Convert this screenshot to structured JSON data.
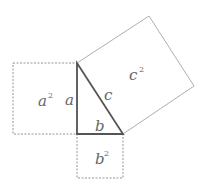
{
  "diagram": {
    "colors": {
      "triangle_stroke": "#555555",
      "square_stroke": "#888888",
      "label": "#666666"
    },
    "triangle": {
      "vertices": [
        [
          77,
          63
        ],
        [
          77,
          134
        ],
        [
          123,
          134
        ]
      ],
      "side_labels": {
        "a": "a",
        "b": "b",
        "c": "c"
      }
    },
    "squares": {
      "a_squared": {
        "label_base": "a",
        "label_exp": "2",
        "vertices": [
          [
            13,
            63
          ],
          [
            77,
            63
          ],
          [
            77,
            134
          ],
          [
            13,
            134
          ]
        ]
      },
      "b_squared": {
        "label_base": "b",
        "label_exp": "2",
        "vertices": [
          [
            77,
            134
          ],
          [
            123,
            134
          ],
          [
            123,
            178
          ],
          [
            77,
            178
          ]
        ]
      },
      "c_squared": {
        "label_base": "c",
        "label_exp": "2",
        "vertices": [
          [
            77,
            63
          ],
          [
            149,
            16
          ],
          [
            194,
            86
          ],
          [
            123,
            134
          ]
        ]
      }
    }
  }
}
